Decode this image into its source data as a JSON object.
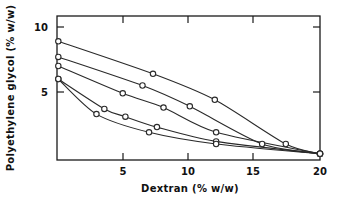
{
  "chart_data": {
    "type": "line",
    "title": "",
    "xlabel": "Dextran (% w/w)",
    "ylabel": "Polyethylene glycol (% w/w)",
    "xlim": [
      0,
      20
    ],
    "ylim": [
      0,
      11.2
    ],
    "xticks": [
      5,
      10,
      15,
      20
    ],
    "xticklabels": [
      "5",
      "10",
      "15",
      "20"
    ],
    "yticks": [
      5,
      10
    ],
    "yticklabels": [
      "5",
      "10"
    ],
    "grid": false,
    "legend": null,
    "marker": "open-circle",
    "series": [
      {
        "name": "binodal-1",
        "comment": "uppermost curve",
        "points": [
          {
            "x": 0.1,
            "y": 8.9
          },
          {
            "x": 7.3,
            "y": 6.4
          },
          {
            "x": 12.0,
            "y": 4.4
          },
          {
            "x": 17.4,
            "y": 1.0
          },
          {
            "x": 20.0,
            "y": 0.25
          }
        ]
      },
      {
        "name": "binodal-2",
        "comment": "second curve",
        "points": [
          {
            "x": 0.1,
            "y": 7.7
          },
          {
            "x": 6.5,
            "y": 5.5
          },
          {
            "x": 10.1,
            "y": 3.9
          },
          {
            "x": 15.6,
            "y": 1.0
          },
          {
            "x": 20.0,
            "y": 0.25
          }
        ]
      },
      {
        "name": "binodal-3",
        "comment": "third curve",
        "points": [
          {
            "x": 0.1,
            "y": 7.0
          },
          {
            "x": 5.0,
            "y": 4.9
          },
          {
            "x": 8.1,
            "y": 3.8
          },
          {
            "x": 12.1,
            "y": 1.9
          },
          {
            "x": 20.0,
            "y": 0.25
          }
        ]
      },
      {
        "name": "binodal-4",
        "comment": "lowest curve, strongly convex",
        "points": [
          {
            "x": 0.1,
            "y": 6.0
          },
          {
            "x": 3.6,
            "y": 3.7
          },
          {
            "x": 5.2,
            "y": 3.1
          },
          {
            "x": 7.6,
            "y": 2.3
          },
          {
            "x": 12.1,
            "y": 1.2
          },
          {
            "x": 20.0,
            "y": 0.25
          }
        ]
      },
      {
        "name": "tieline-lower-branch",
        "comment": "lower envelope arc from left axis to convergence",
        "points": [
          {
            "x": 0.1,
            "y": 6.0
          },
          {
            "x": 3.0,
            "y": 3.3
          },
          {
            "x": 7.0,
            "y": 1.9
          },
          {
            "x": 12.1,
            "y": 1.0
          },
          {
            "x": 20.0,
            "y": 0.25
          }
        ]
      }
    ]
  },
  "axes": {
    "xlabel": "Dextran (% w/w)",
    "ylabel": "Polyethylene glycol (% w/w)",
    "xtick_5": "5",
    "xtick_10": "10",
    "xtick_15": "15",
    "xtick_20": "20",
    "ytick_5": "5",
    "ytick_10": "10"
  },
  "colors": {
    "line": "#2a2a2a",
    "axis": "#1a1a1a",
    "marker_fill": "#ffffff",
    "background": "#ffffff"
  }
}
